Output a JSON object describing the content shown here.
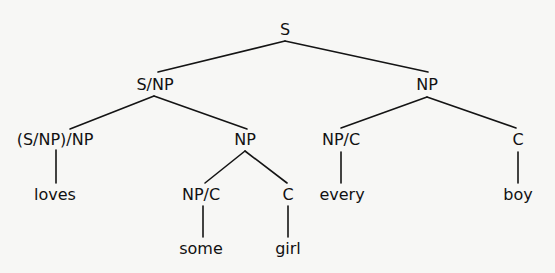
{
  "diagram": {
    "type": "parse-tree",
    "nodes": {
      "root": {
        "label": "S",
        "x": 285,
        "y": 30
      },
      "s_np": {
        "label": "S/NP",
        "x": 155,
        "y": 84
      },
      "np_obj": {
        "label": "NP",
        "x": 427,
        "y": 84
      },
      "verb_cat": {
        "label": "(S/NP)/NP",
        "x": 55,
        "y": 139
      },
      "np_subj": {
        "label": "NP",
        "x": 245,
        "y": 139
      },
      "det_every": {
        "label": "NP/C",
        "x": 341,
        "y": 139
      },
      "c_boy": {
        "label": "C",
        "x": 518,
        "y": 139
      },
      "loves": {
        "label": "loves",
        "x": 55,
        "y": 194
      },
      "det_some": {
        "label": "NP/C",
        "x": 201,
        "y": 194
      },
      "c_girl": {
        "label": "C",
        "x": 288,
        "y": 194
      },
      "every": {
        "label": "every",
        "x": 342,
        "y": 194
      },
      "boy": {
        "label": "boy",
        "x": 518,
        "y": 194
      },
      "some": {
        "label": "some",
        "x": 201,
        "y": 248
      },
      "girl": {
        "label": "girl",
        "x": 288,
        "y": 248
      }
    },
    "edges": [
      {
        "from": "root",
        "to": "s_np"
      },
      {
        "from": "root",
        "to": "np_obj"
      },
      {
        "from": "s_np",
        "to": "verb_cat"
      },
      {
        "from": "s_np",
        "to": "np_subj"
      },
      {
        "from": "np_obj",
        "to": "det_every"
      },
      {
        "from": "np_obj",
        "to": "c_boy"
      },
      {
        "from": "verb_cat",
        "to": "loves"
      },
      {
        "from": "np_subj",
        "to": "det_some"
      },
      {
        "from": "np_subj",
        "to": "c_girl"
      },
      {
        "from": "det_every",
        "to": "every"
      },
      {
        "from": "c_boy",
        "to": "boy"
      },
      {
        "from": "det_some",
        "to": "some"
      },
      {
        "from": "c_girl",
        "to": "girl"
      }
    ],
    "colors": {
      "background": "#f7f7f5",
      "ink": "#141414"
    }
  }
}
